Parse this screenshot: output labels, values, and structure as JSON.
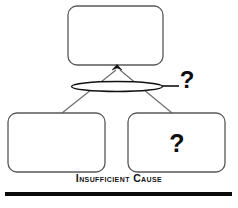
{
  "figure": {
    "caption": "Insufficient Cause",
    "type": "causal-diagram"
  },
  "nodes": {
    "top_box": {
      "label": "",
      "name": "effect-box"
    },
    "bottom_left_box": {
      "label": "",
      "name": "cause-box-left"
    },
    "bottom_right_box": {
      "label": "?",
      "name": "cause-box-right"
    }
  },
  "annotations": {
    "ellipse_marker": "?",
    "ellipse_label": "interaction-ellipse"
  },
  "colors": {
    "box_stroke": "#58585a",
    "connector": "#6a6a6c",
    "ink": "#111111",
    "background": "#ffffff",
    "rule": "#0a0a0a"
  }
}
